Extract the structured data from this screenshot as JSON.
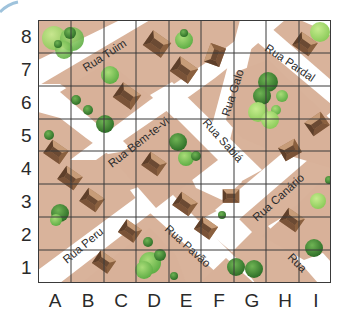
{
  "map": {
    "grid": {
      "columns": [
        "A",
        "B",
        "C",
        "D",
        "E",
        "F",
        "G",
        "H",
        "I"
      ],
      "rows": [
        "8",
        "7",
        "6",
        "5",
        "4",
        "3",
        "2",
        "1"
      ]
    },
    "streets": [
      {
        "name": "Rua Tuim",
        "label": "Rua Tuim"
      },
      {
        "name": "Rua Bem-te-vi",
        "label": "Rua Bem-te-vi"
      },
      {
        "name": "Rua Sabiá",
        "label": "Rua Sabiá"
      },
      {
        "name": "Rua Galo",
        "label": "Rua Galo"
      },
      {
        "name": "Rua Pardal",
        "label": "Rua Pardal"
      },
      {
        "name": "Rua Canário",
        "label": "Rua Canário"
      },
      {
        "name": "Rua Peru",
        "label": "Rua Peru"
      },
      {
        "name": "Rua Pavão",
        "label": "Rua Pavão"
      },
      {
        "name": "Rua",
        "label": "Rua"
      }
    ],
    "colors": {
      "block": "#d9b39b",
      "road": "#ffffff",
      "grid_line": "#3a3a3a",
      "house_roof_dark": "#6b4a33",
      "house_roof_light": "#a57a58",
      "tree_dark": "#3f8a35",
      "tree_light": "#9fd36a"
    }
  }
}
